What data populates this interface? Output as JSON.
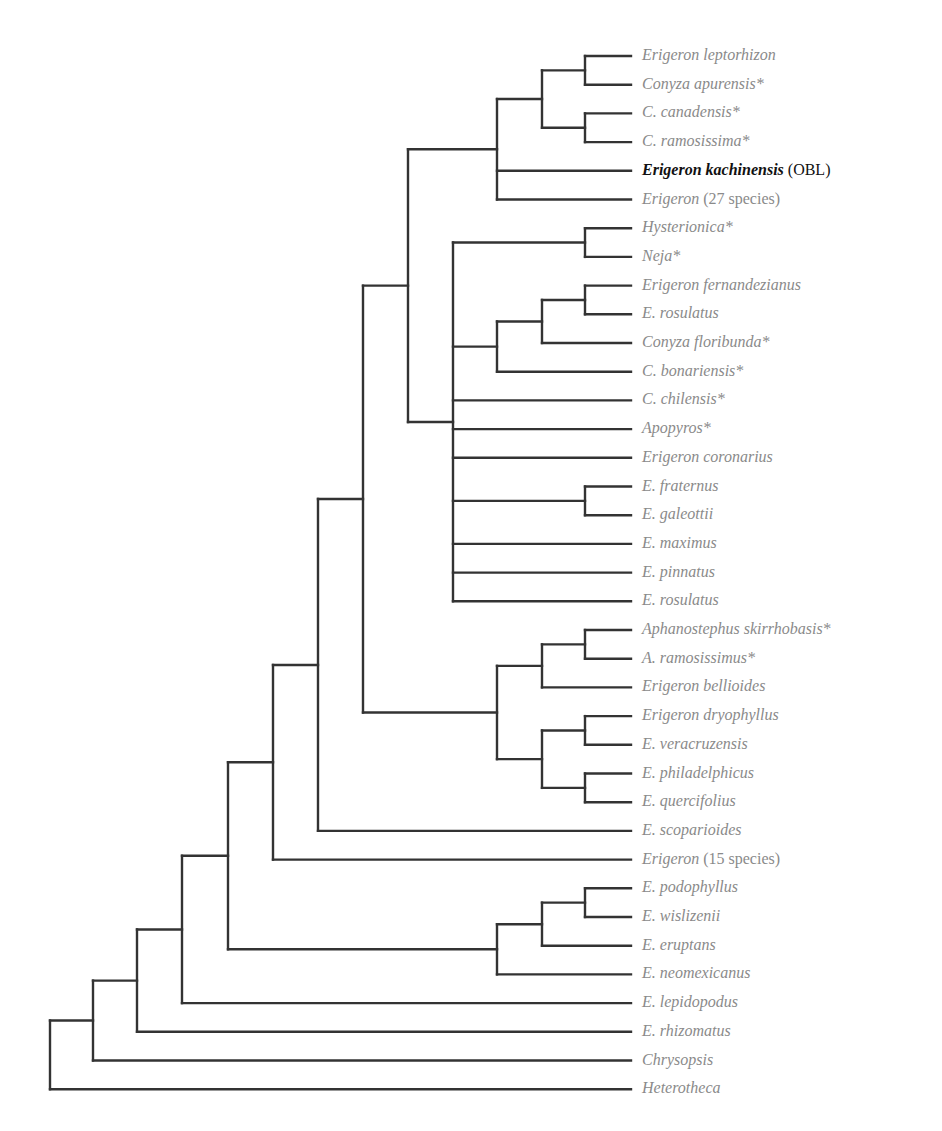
{
  "figure": {
    "type": "phylogenetic-tree",
    "colors": {
      "branch": "#333333",
      "label": "#8a8a8a",
      "highlight": "#111111"
    },
    "layout": {
      "first_leaf_y": 56,
      "leaf_spacing": 28.7,
      "leaf_end_x": 631,
      "label_x": 642,
      "columns_x": [
        50,
        93,
        137,
        182,
        228,
        273,
        318,
        363,
        408,
        453,
        497,
        542,
        585
      ]
    },
    "leaves": [
      {
        "name": "Erigeron leptorhizon",
        "suffix": ""
      },
      {
        "name": "Conyza apurensis*",
        "suffix": ""
      },
      {
        "name": "C. canadensis*",
        "suffix": ""
      },
      {
        "name": "C. ramosissima*",
        "suffix": ""
      },
      {
        "name": "Erigeron kachinensis",
        "suffix": " (OBL)",
        "highlight": true
      },
      {
        "name": "Erigeron",
        "suffix": " (27 species)"
      },
      {
        "name": "Hysterionica*",
        "suffix": ""
      },
      {
        "name": "Neja*",
        "suffix": ""
      },
      {
        "name": "Erigeron fernandezianus",
        "suffix": ""
      },
      {
        "name": "E. rosulatus",
        "suffix": ""
      },
      {
        "name": "Conyza floribunda*",
        "suffix": ""
      },
      {
        "name": "C. bonariensis*",
        "suffix": ""
      },
      {
        "name": "C. chilensis*",
        "suffix": ""
      },
      {
        "name": "Apopyros*",
        "suffix": ""
      },
      {
        "name": "Erigeron coronarius",
        "suffix": ""
      },
      {
        "name": "E. fraternus",
        "suffix": ""
      },
      {
        "name": "E. galeottii",
        "suffix": ""
      },
      {
        "name": "E. maximus",
        "suffix": ""
      },
      {
        "name": "E. pinnatus",
        "suffix": ""
      },
      {
        "name": "E. rosulatus",
        "suffix": ""
      },
      {
        "name": "Aphanostephus skirrhobasis*",
        "suffix": ""
      },
      {
        "name": "A. ramosissimus*",
        "suffix": ""
      },
      {
        "name": "Erigeron bellioides",
        "suffix": ""
      },
      {
        "name": "Erigeron dryophyllus",
        "suffix": ""
      },
      {
        "name": "E. veracruzensis",
        "suffix": ""
      },
      {
        "name": "E. philadelphicus",
        "suffix": ""
      },
      {
        "name": "E. quercifolius",
        "suffix": ""
      },
      {
        "name": "E. scoparioides",
        "suffix": ""
      },
      {
        "name": "Erigeron",
        "suffix": " (15 species)"
      },
      {
        "name": "E. podophyllus",
        "suffix": ""
      },
      {
        "name": "E. wislizenii",
        "suffix": ""
      },
      {
        "name": "E. eruptans",
        "suffix": ""
      },
      {
        "name": "E. neomexicanus",
        "suffix": ""
      },
      {
        "name": "E. lepidopodus",
        "suffix": ""
      },
      {
        "name": "E. rhizomatus",
        "suffix": ""
      },
      {
        "name": "Chrysopsis",
        "suffix": ""
      },
      {
        "name": "Heterotheca",
        "suffix": ""
      }
    ],
    "tree": {
      "col": 0,
      "children": [
        {
          "col": 1,
          "children": [
            {
              "col": 2,
              "children": [
                {
                  "col": 3,
                  "children": [
                    {
                      "col": 4,
                      "children": [
                        {
                          "col": 5,
                          "children": [
                            {
                              "col": 6,
                              "children": [
                                {
                                  "col": 7,
                                  "children": [
                                    {
                                      "col": 8,
                                      "children": [
                                        {
                                          "col": 10,
                                          "children": [
                                            {
                                              "col": 11,
                                              "children": [
                                                {
                                                  "col": 12,
                                                  "children": [
                                                    {
                                                      "leaf": 0
                                                    },
                                                    {
                                                      "leaf": 1
                                                    }
                                                  ]
                                                },
                                                {
                                                  "col": 12,
                                                  "children": [
                                                    {
                                                      "leaf": 2
                                                    },
                                                    {
                                                      "leaf": 3
                                                    }
                                                  ]
                                                }
                                              ]
                                            },
                                            {
                                              "leaf": 4
                                            },
                                            {
                                              "leaf": 5
                                            }
                                          ]
                                        },
                                        {
                                          "col": 9,
                                          "children": [
                                            {
                                              "col": 12,
                                              "children": [
                                                {
                                                  "leaf": 6
                                                },
                                                {
                                                  "leaf": 7
                                                }
                                              ]
                                            },
                                            {
                                              "col": 10,
                                              "children": [
                                                {
                                                  "col": 11,
                                                  "children": [
                                                    {
                                                      "col": 12,
                                                      "children": [
                                                        {
                                                          "leaf": 8
                                                        },
                                                        {
                                                          "leaf": 9
                                                        }
                                                      ]
                                                    },
                                                    {
                                                      "leaf": 10
                                                    }
                                                  ]
                                                },
                                                {
                                                  "leaf": 11
                                                }
                                              ]
                                            },
                                            {
                                              "leaf": 12
                                            },
                                            {
                                              "leaf": 13
                                            },
                                            {
                                              "leaf": 14
                                            },
                                            {
                                              "col": 12,
                                              "children": [
                                                {
                                                  "leaf": 15
                                                },
                                                {
                                                  "leaf": 16
                                                }
                                              ]
                                            },
                                            {
                                              "leaf": 17
                                            },
                                            {
                                              "leaf": 18
                                            },
                                            {
                                              "leaf": 19
                                            }
                                          ]
                                        }
                                      ]
                                    },
                                    {
                                      "col": 10,
                                      "children": [
                                        {
                                          "col": 11,
                                          "children": [
                                            {
                                              "col": 12,
                                              "children": [
                                                {
                                                  "leaf": 20
                                                },
                                                {
                                                  "leaf": 21
                                                }
                                              ]
                                            },
                                            {
                                              "leaf": 22
                                            }
                                          ]
                                        },
                                        {
                                          "col": 11,
                                          "children": [
                                            {
                                              "col": 12,
                                              "children": [
                                                {
                                                  "leaf": 23
                                                },
                                                {
                                                  "leaf": 24
                                                }
                                              ]
                                            },
                                            {
                                              "col": 12,
                                              "children": [
                                                {
                                                  "leaf": 25
                                                },
                                                {
                                                  "leaf": 26
                                                }
                                              ]
                                            }
                                          ]
                                        }
                                      ]
                                    }
                                  ]
                                },
                                {
                                  "leaf": 27
                                }
                              ]
                            },
                            {
                              "leaf": 28
                            }
                          ]
                        },
                        {
                          "col": 10,
                          "children": [
                            {
                              "col": 11,
                              "children": [
                                {
                                  "col": 12,
                                  "children": [
                                    {
                                      "leaf": 29
                                    },
                                    {
                                      "leaf": 30
                                    }
                                  ]
                                },
                                {
                                  "leaf": 31
                                }
                              ]
                            },
                            {
                              "leaf": 32
                            }
                          ]
                        }
                      ]
                    },
                    {
                      "leaf": 33
                    }
                  ]
                },
                {
                  "leaf": 34
                }
              ]
            },
            {
              "leaf": 35
            }
          ]
        },
        {
          "leaf": 36
        }
      ]
    }
  }
}
